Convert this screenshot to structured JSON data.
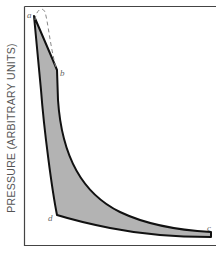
{
  "diagram": {
    "title": "",
    "y_axis_label": "PRESSURE (ARBITRARY UNITS)",
    "x_axis_label": "",
    "points": {
      "a": {
        "label": "a"
      },
      "b": {
        "label": "b"
      },
      "c": {
        "label": "c"
      },
      "d": {
        "label": "d"
      }
    },
    "colors": {
      "fill": "#b3b3b3",
      "stroke": "#111111",
      "frame": "#333333",
      "dashed": "#888888",
      "label": "#666666"
    }
  }
}
